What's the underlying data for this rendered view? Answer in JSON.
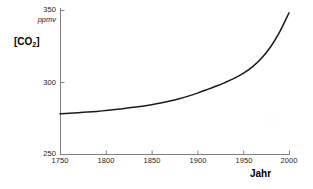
{
  "chart_data": {
    "type": "line",
    "title": "",
    "xlabel": "Jahr",
    "ylabel": "[CO2]",
    "ylabel_display": "[CO",
    "ylabel_sub": "2",
    "ylabel_tail": "]",
    "unit": "ppmv",
    "xlim": [
      1750,
      2000
    ],
    "ylim": [
      250,
      350
    ],
    "grid": false,
    "legend": null,
    "x_ticks": [
      1750,
      1800,
      1850,
      1900,
      1950,
      2000
    ],
    "x_tick_labels": [
      "1750",
      "1800",
      "1850",
      "1900",
      "1950",
      "2000"
    ],
    "y_ticks": [
      250,
      300,
      350
    ],
    "y_tick_labels": [
      "250",
      "300",
      "350"
    ],
    "series": [
      {
        "name": "CO2 concentration",
        "color": "#1a1a1a",
        "x": [
          1750,
          1760,
          1770,
          1780,
          1790,
          1800,
          1810,
          1820,
          1830,
          1840,
          1850,
          1860,
          1870,
          1880,
          1890,
          1900,
          1910,
          1920,
          1930,
          1940,
          1950,
          1960,
          1970,
          1980,
          1990,
          2000
        ],
        "values": [
          278.0,
          278.3,
          278.7,
          279.1,
          279.6,
          280.2,
          280.9,
          281.6,
          282.4,
          283.2,
          284.2,
          285.4,
          286.8,
          288.4,
          290.2,
          292.3,
          294.6,
          297.0,
          299.6,
          302.5,
          306.0,
          310.5,
          316.5,
          324.5,
          335.0,
          348.0
        ]
      }
    ],
    "stray_marks": [
      {
        "x_px": 272,
        "y_px": 120,
        "size": 1
      }
    ]
  },
  "axes": {
    "plot_left_px": 60,
    "plot_right_px": 289,
    "plot_top_px": 10,
    "plot_bottom_px": 154,
    "spine_color": "#808080"
  }
}
